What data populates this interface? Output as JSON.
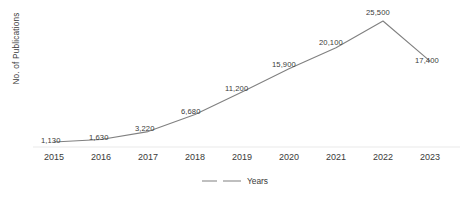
{
  "chart_data": {
    "type": "line",
    "title": "",
    "subtitle": "",
    "xlabel": "",
    "ylabel": "No. of Publications",
    "categories": [
      "2015",
      "2016",
      "2017",
      "2018",
      "2019",
      "2020",
      "2021",
      "2022",
      "2023"
    ],
    "values": [
      1130,
      1630,
      3220,
      6680,
      11200,
      15900,
      20100,
      25500,
      17400
    ],
    "data_labels": [
      "1,130",
      "1,630",
      "3,220",
      "6,680",
      "11,200",
      "15,900",
      "20,100",
      "25,500",
      "17,400"
    ],
    "series": [
      {
        "name": "Years",
        "values": [
          1130,
          1630,
          3220,
          6680,
          11200,
          15900,
          20100,
          25500,
          17400
        ]
      }
    ],
    "legend": [
      "Years"
    ],
    "legend_position": "bottom",
    "grid": false,
    "y_axis_visible": false,
    "y_tick_labels": [],
    "x_tick_labels": [
      "2015",
      "2016",
      "2017",
      "2018",
      "2019",
      "2020",
      "2021",
      "2022",
      "2023"
    ],
    "ylim": [
      0,
      27000
    ],
    "line_color": "#808080",
    "axis_color": "#e6e6e6",
    "text_color": "#3a3a3a",
    "background": "#ffffff"
  },
  "axis": {
    "y_title": "No. of Publications"
  },
  "legend": {
    "series_label": "Years"
  }
}
